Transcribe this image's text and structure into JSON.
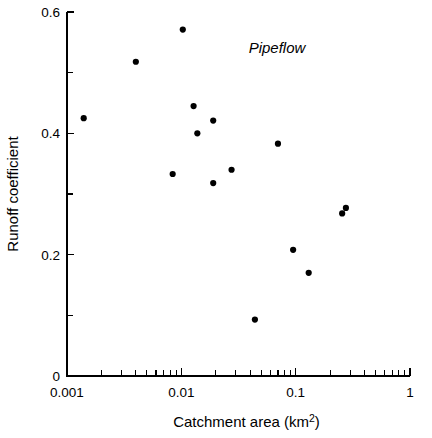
{
  "chart_data": {
    "type": "scatter",
    "title": "",
    "annotation": "Pipeflow",
    "xlabel": "Catchment area (km2)",
    "xlabel_base": "Catchment area (km",
    "xlabel_sup": "2",
    "xlabel_close": ")",
    "ylabel": "Runoff coefficient",
    "xscale": "log",
    "yscale": "linear",
    "xlim": [
      0.001,
      1
    ],
    "ylim": [
      0,
      0.6
    ],
    "grid": false,
    "legend": "none",
    "xticks_major": [
      0.001,
      0.01,
      0.1,
      1
    ],
    "xticklabels_major": [
      "0.001",
      "0.01",
      "0.1",
      "1"
    ],
    "xticks_minor": [
      0.002,
      0.003,
      0.004,
      0.005,
      0.006,
      0.007,
      0.008,
      0.009,
      0.02,
      0.03,
      0.04,
      0.05,
      0.06,
      0.07,
      0.08,
      0.09,
      0.2,
      0.3,
      0.4,
      0.5,
      0.6,
      0.7,
      0.8,
      0.9
    ],
    "yticks_major": [
      0,
      0.2,
      0.4,
      0.6
    ],
    "yticklabels_major": [
      "0",
      "0.2",
      "0.4",
      "0.6"
    ],
    "yticks_minor": [
      0.1,
      0.3,
      0.5
    ],
    "marker": {
      "shape": "circle",
      "color": "#000000",
      "size_px": 6.2
    },
    "series": [
      {
        "name": "Pipeflow",
        "points": [
          {
            "x": 0.0014,
            "y": 0.425
          },
          {
            "x": 0.004,
            "y": 0.518
          },
          {
            "x": 0.0103,
            "y": 0.571
          },
          {
            "x": 0.0084,
            "y": 0.333
          },
          {
            "x": 0.0128,
            "y": 0.445
          },
          {
            "x": 0.0138,
            "y": 0.4
          },
          {
            "x": 0.019,
            "y": 0.421
          },
          {
            "x": 0.019,
            "y": 0.318
          },
          {
            "x": 0.0275,
            "y": 0.34
          },
          {
            "x": 0.044,
            "y": 0.093
          },
          {
            "x": 0.07,
            "y": 0.383
          },
          {
            "x": 0.095,
            "y": 0.208
          },
          {
            "x": 0.13,
            "y": 0.17
          },
          {
            "x": 0.255,
            "y": 0.268
          },
          {
            "x": 0.275,
            "y": 0.277
          }
        ]
      }
    ]
  },
  "geometry": {
    "plot_left": 67,
    "plot_right": 410,
    "plot_top": 12,
    "plot_bottom": 376
  }
}
